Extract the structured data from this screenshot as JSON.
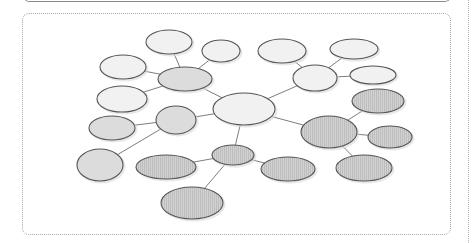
{
  "diagram": {
    "type": "mind-map",
    "style": "hand-drawn bubble map",
    "fills": {
      "light": "#f1f1f1",
      "medium": "#dcdcdc",
      "striped": "#cfcfcf",
      "stripe_line": "#bdbdbd"
    },
    "nodes": [
      {
        "id": "A",
        "cx": 169,
        "cy": 42,
        "rx": 23,
        "ry": 12,
        "fill": "light"
      },
      {
        "id": "B",
        "cx": 221,
        "cy": 51,
        "rx": 19,
        "ry": 11,
        "fill": "light"
      },
      {
        "id": "C",
        "cx": 185,
        "cy": 79,
        "rx": 27,
        "ry": 12,
        "fill": "medium"
      },
      {
        "id": "D",
        "cx": 123,
        "cy": 67,
        "rx": 23,
        "ry": 12,
        "fill": "light"
      },
      {
        "id": "E",
        "cx": 122,
        "cy": 99,
        "rx": 25,
        "ry": 13,
        "fill": "light"
      },
      {
        "id": "F",
        "cx": 244,
        "cy": 109,
        "rx": 31,
        "ry": 16,
        "fill": "light"
      },
      {
        "id": "G",
        "cx": 282,
        "cy": 51,
        "rx": 24,
        "ry": 12,
        "fill": "light"
      },
      {
        "id": "H",
        "cx": 354,
        "cy": 49,
        "rx": 24,
        "ry": 10,
        "fill": "light"
      },
      {
        "id": "I",
        "cx": 315,
        "cy": 78,
        "rx": 22,
        "ry": 13,
        "fill": "light"
      },
      {
        "id": "J",
        "cx": 373,
        "cy": 75,
        "rx": 23,
        "ry": 9,
        "fill": "light"
      },
      {
        "id": "K",
        "cx": 378,
        "cy": 101,
        "rx": 26,
        "ry": 12,
        "fill": "striped"
      },
      {
        "id": "L",
        "cx": 329,
        "cy": 132,
        "rx": 28,
        "ry": 16,
        "fill": "striped"
      },
      {
        "id": "M",
        "cx": 390,
        "cy": 137,
        "rx": 22,
        "ry": 11,
        "fill": "striped"
      },
      {
        "id": "N",
        "cx": 364,
        "cy": 168,
        "rx": 28,
        "ry": 13,
        "fill": "striped"
      },
      {
        "id": "O",
        "cx": 176,
        "cy": 120,
        "rx": 20,
        "ry": 14,
        "fill": "medium"
      },
      {
        "id": "P",
        "cx": 112,
        "cy": 128,
        "rx": 23,
        "ry": 12,
        "fill": "medium"
      },
      {
        "id": "Q",
        "cx": 100,
        "cy": 165,
        "rx": 23,
        "ry": 16,
        "fill": "medium"
      },
      {
        "id": "R",
        "cx": 166,
        "cy": 167,
        "rx": 30,
        "ry": 12,
        "fill": "striped"
      },
      {
        "id": "S",
        "cx": 233,
        "cy": 155,
        "rx": 21,
        "ry": 10,
        "fill": "striped"
      },
      {
        "id": "T",
        "cx": 288,
        "cy": 169,
        "rx": 27,
        "ry": 12,
        "fill": "striped"
      },
      {
        "id": "U",
        "cx": 192,
        "cy": 203,
        "rx": 31,
        "ry": 16,
        "fill": "striped"
      }
    ],
    "edges": [
      [
        "A",
        "C"
      ],
      [
        "B",
        "C"
      ],
      [
        "D",
        "C"
      ],
      [
        "E",
        "C"
      ],
      [
        "C",
        "F"
      ],
      [
        "G",
        "I"
      ],
      [
        "H",
        "I"
      ],
      [
        "J",
        "I"
      ],
      [
        "I",
        "F"
      ],
      [
        "F",
        "L"
      ],
      [
        "K",
        "L"
      ],
      [
        "M",
        "L"
      ],
      [
        "N",
        "L"
      ],
      [
        "F",
        "O"
      ],
      [
        "P",
        "O"
      ],
      [
        "Q",
        "O"
      ],
      [
        "F",
        "S"
      ],
      [
        "R",
        "S"
      ],
      [
        "T",
        "S"
      ],
      [
        "U",
        "S"
      ]
    ]
  }
}
